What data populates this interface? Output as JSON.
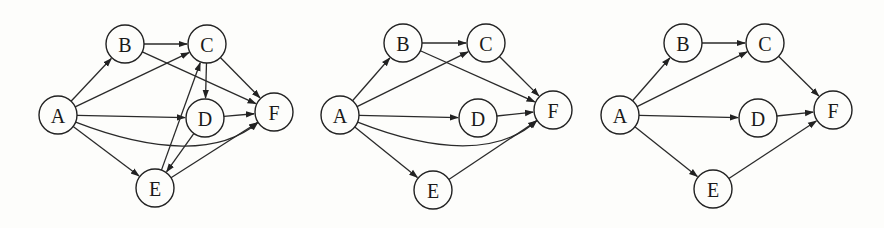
{
  "graphs": [
    {
      "id": "graph-1",
      "nodes": [
        {
          "id": "A",
          "label": "A",
          "x": 58,
          "y": 115
        },
        {
          "id": "B",
          "label": "B",
          "x": 125,
          "y": 44
        },
        {
          "id": "C",
          "label": "C",
          "x": 207,
          "y": 44
        },
        {
          "id": "D",
          "label": "D",
          "x": 205,
          "y": 118
        },
        {
          "id": "E",
          "label": "E",
          "x": 155,
          "y": 188
        },
        {
          "id": "F",
          "label": "F",
          "x": 274,
          "y": 112
        }
      ],
      "edges": [
        {
          "from": "A",
          "to": "B"
        },
        {
          "from": "A",
          "to": "C"
        },
        {
          "from": "A",
          "to": "D"
        },
        {
          "from": "A",
          "to": "E"
        },
        {
          "from": "A",
          "to": "F",
          "curved": true
        },
        {
          "from": "B",
          "to": "C"
        },
        {
          "from": "B",
          "to": "F"
        },
        {
          "from": "C",
          "to": "D"
        },
        {
          "from": "C",
          "to": "F"
        },
        {
          "from": "D",
          "to": "F"
        },
        {
          "from": "D",
          "to": "E"
        },
        {
          "from": "E",
          "to": "C"
        },
        {
          "from": "E",
          "to": "F"
        }
      ]
    },
    {
      "id": "graph-2",
      "nodes": [
        {
          "id": "A",
          "label": "A",
          "x": 340,
          "y": 115
        },
        {
          "id": "B",
          "label": "B",
          "x": 403,
          "y": 43
        },
        {
          "id": "C",
          "label": "C",
          "x": 486,
          "y": 43
        },
        {
          "id": "D",
          "label": "D",
          "x": 478,
          "y": 118
        },
        {
          "id": "E",
          "label": "E",
          "x": 433,
          "y": 190
        },
        {
          "id": "F",
          "label": "F",
          "x": 553,
          "y": 110
        }
      ],
      "edges": [
        {
          "from": "A",
          "to": "B"
        },
        {
          "from": "A",
          "to": "C"
        },
        {
          "from": "A",
          "to": "D"
        },
        {
          "from": "A",
          "to": "E"
        },
        {
          "from": "A",
          "to": "F",
          "curved": true
        },
        {
          "from": "B",
          "to": "C"
        },
        {
          "from": "B",
          "to": "F"
        },
        {
          "from": "C",
          "to": "F"
        },
        {
          "from": "D",
          "to": "F"
        },
        {
          "from": "E",
          "to": "F"
        }
      ]
    },
    {
      "id": "graph-3",
      "nodes": [
        {
          "id": "A",
          "label": "A",
          "x": 620,
          "y": 115
        },
        {
          "id": "B",
          "label": "B",
          "x": 683,
          "y": 43
        },
        {
          "id": "C",
          "label": "C",
          "x": 765,
          "y": 43
        },
        {
          "id": "D",
          "label": "D",
          "x": 758,
          "y": 118
        },
        {
          "id": "E",
          "label": "E",
          "x": 713,
          "y": 189
        },
        {
          "id": "F",
          "label": "F",
          "x": 833,
          "y": 110
        }
      ],
      "edges": [
        {
          "from": "A",
          "to": "B"
        },
        {
          "from": "A",
          "to": "C"
        },
        {
          "from": "A",
          "to": "D"
        },
        {
          "from": "A",
          "to": "E"
        },
        {
          "from": "B",
          "to": "C"
        },
        {
          "from": "C",
          "to": "F"
        },
        {
          "from": "D",
          "to": "F"
        },
        {
          "from": "E",
          "to": "F"
        }
      ]
    }
  ],
  "style": {
    "node_radius": 19,
    "stroke": "#222222",
    "background": "#fdfdfb"
  }
}
